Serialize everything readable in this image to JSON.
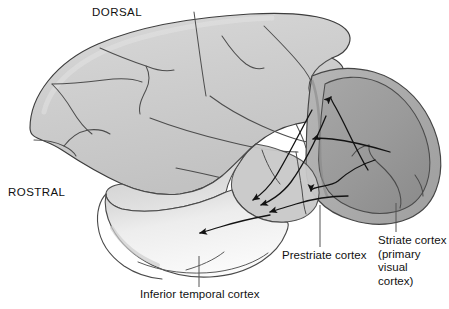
{
  "figure": {
    "type": "anatomical-diagram",
    "background_color": "#ffffff"
  },
  "orientation_labels": {
    "dorsal": "DORSAL",
    "rostral": "ROSTRAL"
  },
  "region_labels": {
    "prestriate": "Prestriate cortex",
    "striate": "Striate cortex\n(primary visual\ncortex)",
    "inferior_temporal": "Inferior temporal cortex"
  },
  "colors": {
    "cortex_fill": "#cdcdcd",
    "cortex_fill_light": "#d6d6d6",
    "striate_fill": "#9b9b9b",
    "striate_fill_dark": "#8d8d8d",
    "temporal_fill": "#e9e9e9",
    "temporal_fill_light": "#fafafa",
    "outline": "#3a3a3a",
    "sulci": "#4a4a4a",
    "arrow": "#121212",
    "leader_line": "#555555",
    "text": "#111111"
  },
  "pathway_arrows": {
    "count": 7,
    "description": "arrows from striate cortex to prestriate cortex and onward to inferior temporal cortex"
  },
  "leader_lines": [
    {
      "name": "prestriate-leader",
      "x": 320,
      "y_top": 205,
      "y_bottom": 247
    },
    {
      "name": "striate-leader",
      "x": 396,
      "y_top": 204,
      "y_bottom": 232
    },
    {
      "name": "inferior-temporal-leader",
      "x": 199,
      "y_top": 256,
      "y_bottom": 287
    }
  ]
}
